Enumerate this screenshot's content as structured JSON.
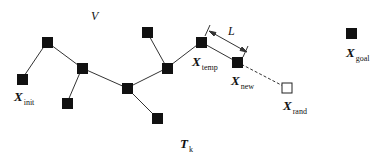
{
  "diagram": {
    "space_label": "V",
    "tree_label": {
      "main": "T",
      "sub": "k"
    },
    "step_label": "L",
    "colors": {
      "node": "#111111",
      "edge": "#333333",
      "background": "#ffffff",
      "rand_node_fill": "#ffffff"
    },
    "nodes": [
      {
        "id": "n_a",
        "x": 47,
        "y": 42,
        "label": null
      },
      {
        "id": "x_init",
        "x": 22,
        "y": 79,
        "label": {
          "main": "X",
          "sub": "init"
        }
      },
      {
        "id": "n_b",
        "x": 82,
        "y": 68,
        "label": null
      },
      {
        "id": "n_c",
        "x": 67,
        "y": 103,
        "label": null
      },
      {
        "id": "n_d",
        "x": 147,
        "y": 32,
        "label": null
      },
      {
        "id": "n_e",
        "x": 167,
        "y": 68,
        "label": null
      },
      {
        "id": "n_f",
        "x": 127,
        "y": 88,
        "label": null
      },
      {
        "id": "n_g",
        "x": 157,
        "y": 118,
        "label": null
      },
      {
        "id": "x_temp",
        "x": 201,
        "y": 42,
        "label": {
          "main": "X",
          "sub": "temp"
        }
      },
      {
        "id": "x_new",
        "x": 237,
        "y": 62,
        "label": {
          "main": "X",
          "sub": "new"
        }
      },
      {
        "id": "x_rand",
        "x": 287,
        "y": 88,
        "label": {
          "main": "X",
          "sub": "rand"
        },
        "hollow": true
      },
      {
        "id": "x_goal",
        "x": 351,
        "y": 33,
        "label": {
          "main": "X",
          "sub": "goal"
        }
      }
    ],
    "edges": [
      {
        "from": "x_init",
        "to": "n_a",
        "style": "solid"
      },
      {
        "from": "n_a",
        "to": "n_b",
        "style": "solid"
      },
      {
        "from": "n_b",
        "to": "n_c",
        "style": "solid"
      },
      {
        "from": "n_b",
        "to": "n_f",
        "style": "solid"
      },
      {
        "from": "n_f",
        "to": "n_g",
        "style": "solid"
      },
      {
        "from": "n_f",
        "to": "n_e",
        "style": "solid"
      },
      {
        "from": "n_e",
        "to": "n_d",
        "style": "solid"
      },
      {
        "from": "n_e",
        "to": "x_temp",
        "style": "solid"
      },
      {
        "from": "x_temp",
        "to": "x_new",
        "style": "solid"
      },
      {
        "from": "x_new",
        "to": "x_rand",
        "style": "dashed"
      }
    ]
  }
}
